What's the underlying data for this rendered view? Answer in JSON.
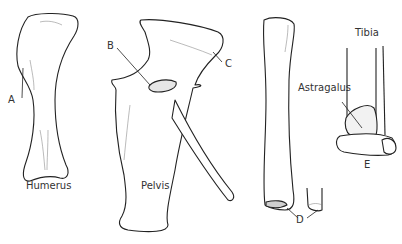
{
  "diagram": {
    "type": "anatomical-illustration",
    "bones": [
      {
        "id": "humerus",
        "label": "Humerus"
      },
      {
        "id": "pelvis",
        "label": "Pelvis"
      },
      {
        "id": "tibia",
        "label": "Tibia"
      }
    ],
    "annotations": [
      {
        "id": "A",
        "label": "A"
      },
      {
        "id": "B",
        "label": "B"
      },
      {
        "id": "C",
        "label": "C"
      },
      {
        "id": "D",
        "label": "D"
      },
      {
        "id": "E",
        "label": "E"
      },
      {
        "id": "astragalus",
        "label": "Astragalus"
      }
    ]
  }
}
